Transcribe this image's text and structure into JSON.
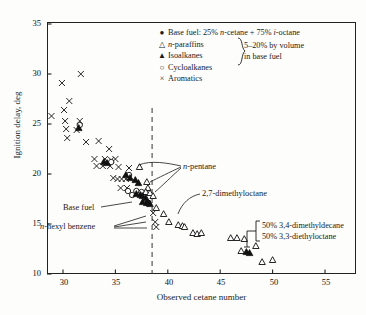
{
  "chart_data": {
    "type": "scatter",
    "title": "",
    "xlabel": "Observed cetane number",
    "ylabel": "Ignition delay, deg",
    "xlim": [
      28,
      58
    ],
    "ylim": [
      9.2,
      36.2
    ],
    "xticks": [
      30,
      35,
      40,
      45,
      50,
      55
    ],
    "yticks": [
      10,
      15,
      20,
      25,
      30,
      35
    ],
    "grid": false,
    "legend_position": "top-right",
    "reference_line": {
      "type": "vertical-dashed",
      "x": 38.5
    },
    "series": [
      {
        "name": "Base fuel: 25% n-cetane + 75% i-octane",
        "marker": "filled-circle",
        "points": [
          [
            38.1,
            17.1
          ]
        ]
      },
      {
        "name": "n-paraffins",
        "marker": "open-triangle",
        "points": [
          [
            37.3,
            20.7
          ],
          [
            38.0,
            19.2
          ],
          [
            38.1,
            18.6
          ],
          [
            37.9,
            18.2
          ],
          [
            38.3,
            18.1
          ],
          [
            38.6,
            17.8
          ],
          [
            38.9,
            16.6
          ],
          [
            39.6,
            16.0
          ],
          [
            40.1,
            15.2
          ],
          [
            41.0,
            14.9
          ],
          [
            41.4,
            14.8
          ],
          [
            41.6,
            14.7
          ],
          [
            42.4,
            14.1
          ],
          [
            42.8,
            14.0
          ],
          [
            43.2,
            14.1
          ],
          [
            46.0,
            13.6
          ],
          [
            46.6,
            13.6
          ],
          [
            47.3,
            13.5
          ],
          [
            47.0,
            12.3
          ],
          [
            48.4,
            12.8
          ],
          [
            49.0,
            11.2
          ],
          [
            50.0,
            11.4
          ]
        ]
      },
      {
        "name": "Isoalkanes",
        "marker": "filled-triangle",
        "points": [
          [
            31.5,
            24.6
          ],
          [
            33.9,
            21.2
          ],
          [
            34.2,
            21.1
          ],
          [
            36.0,
            19.9
          ],
          [
            36.4,
            19.6
          ],
          [
            36.9,
            19.4
          ],
          [
            37.2,
            19.1
          ],
          [
            37.0,
            18.0
          ],
          [
            37.4,
            17.9
          ],
          [
            37.6,
            17.8
          ],
          [
            37.9,
            17.6
          ],
          [
            37.6,
            17.2
          ],
          [
            38.0,
            17.1
          ],
          [
            38.3,
            17.0
          ],
          [
            47.5,
            12.2
          ],
          [
            47.8,
            12.1
          ]
        ]
      },
      {
        "name": "Cycloalkanes",
        "marker": "open-circle",
        "points": [
          [
            31.6,
            24.9
          ],
          [
            34.6,
            21.2
          ],
          [
            36.3,
            19.9
          ],
          [
            36.2,
            18.3
          ],
          [
            37.0,
            18.3
          ],
          [
            37.5,
            18.2
          ],
          [
            36.6,
            17.9
          ]
        ]
      },
      {
        "name": "Aromatics",
        "marker": "cross",
        "points": [
          [
            29.9,
            29.1
          ],
          [
            31.7,
            30.0
          ],
          [
            30.6,
            27.3
          ],
          [
            28.9,
            25.8
          ],
          [
            30.1,
            26.4
          ],
          [
            30.2,
            25.3
          ],
          [
            31.6,
            25.3
          ],
          [
            30.3,
            24.5
          ],
          [
            31.3,
            24.4
          ],
          [
            30.4,
            23.6
          ],
          [
            32.2,
            23.2
          ],
          [
            33.4,
            23.3
          ],
          [
            34.4,
            22.5
          ],
          [
            33.0,
            21.5
          ],
          [
            34.0,
            21.5
          ],
          [
            34.6,
            21.4
          ],
          [
            35.0,
            21.5
          ],
          [
            33.2,
            20.8
          ],
          [
            33.8,
            20.8
          ],
          [
            34.5,
            20.8
          ],
          [
            35.3,
            20.7
          ],
          [
            36.3,
            20.6
          ],
          [
            34.8,
            19.6
          ],
          [
            35.2,
            19.5
          ],
          [
            35.6,
            19.5
          ],
          [
            36.0,
            19.5
          ],
          [
            35.5,
            18.6
          ],
          [
            36.1,
            18.6
          ],
          [
            38.6,
            16.1
          ],
          [
            38.8,
            15.2
          ],
          [
            38.9,
            14.7
          ]
        ]
      }
    ],
    "annotations": [
      {
        "text": "n-pentane",
        "x": 40.8,
        "y": 19.6
      },
      {
        "text": "Base fuel",
        "x": 33.4,
        "y": 15.6
      },
      {
        "text": "n-hexyl benzene",
        "x": 30.6,
        "y": 14.4
      },
      {
        "text": "2,7-dimethyloctane",
        "x": 43.6,
        "y": 16.1
      },
      {
        "text": "50% 3,4-dimethyldecane",
        "x": 49.4,
        "y": 14.1
      },
      {
        "text": "50% 3,3-diethyloctane",
        "x": 49.4,
        "y": 13.2
      }
    ]
  },
  "axes": {
    "ylabel": "Ignition delay, deg",
    "xlabel": "Observed cetane number",
    "yticks": [
      "35",
      "30",
      "25",
      "20",
      "15",
      "10"
    ],
    "xticks": [
      "30",
      "35",
      "40",
      "45",
      "50",
      "55"
    ]
  },
  "legend": {
    "rows": [
      {
        "marker": "●",
        "marker_name": "filled-circle-marker",
        "text": "Base fuel: 25% n-cetane + 75% i-octane"
      },
      {
        "marker": "△",
        "marker_name": "open-triangle-marker",
        "text": "n-paraffins"
      },
      {
        "marker": "▲",
        "marker_name": "filled-triangle-marker",
        "text": "Isoalkanes"
      },
      {
        "marker": "○",
        "marker_name": "open-circle-marker",
        "text": "Cycloalkanes"
      },
      {
        "marker": "×",
        "marker_name": "cross-marker",
        "text": "Aromatics"
      }
    ],
    "brace_line1": "5–20% by volume",
    "brace_line2": "in base fuel"
  },
  "annotations": {
    "n_pentane": "n-pentane",
    "base_fuel": "Base fuel",
    "n_hexyl_benzene": "n-hexyl benzene",
    "dimethyloctane": "2,7-dimethyloctane",
    "bracket_line1": "50% 3,4-dimethyldecane",
    "bracket_line2": "50% 3,3-diethyloctane"
  },
  "colors": {
    "ink": "#1a1a1a",
    "background": "#fdfdfb"
  }
}
